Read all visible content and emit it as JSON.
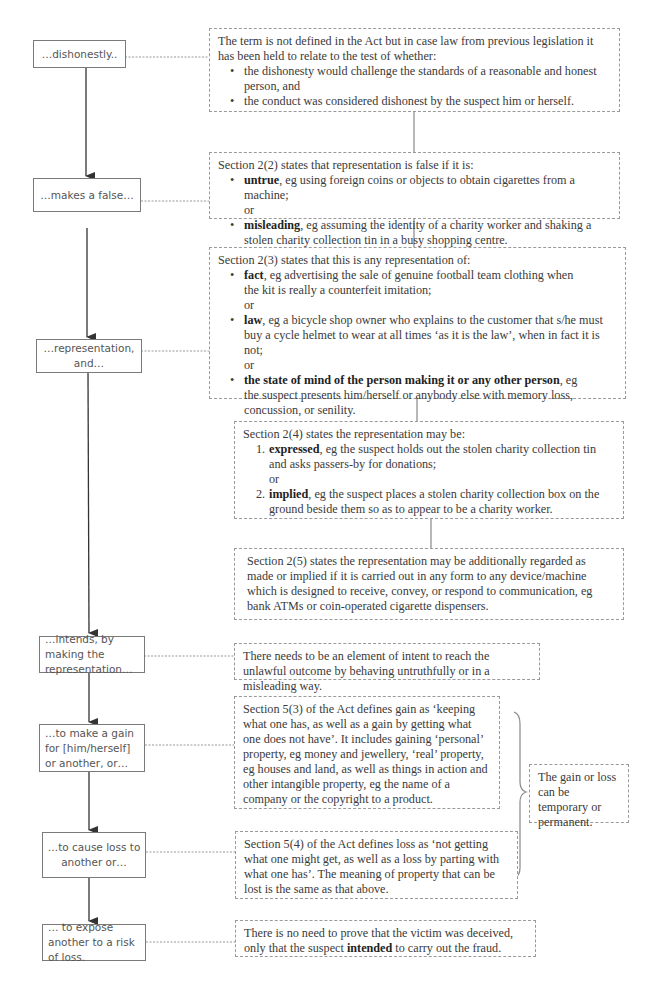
{
  "stages": [
    {
      "id": "dishonestly",
      "label": "…dishonestly.."
    },
    {
      "id": "makes-false",
      "label": "…makes a false…"
    },
    {
      "id": "representation",
      "label": "…representation, and…"
    },
    {
      "id": "intends",
      "label": "…intends, by making the representation…"
    },
    {
      "id": "gain",
      "label": "…to make a gain for [him/herself] or another, or…"
    },
    {
      "id": "loss",
      "label": "…to cause loss to another or…"
    },
    {
      "id": "expose",
      "label": "… to expose another to a risk of loss."
    }
  ],
  "notes": {
    "dishonestly": {
      "intro": "The term is not defined in the Act but in case law from previous legislation it has been held to relate to the test of whether:",
      "bullets": [
        "the dishonesty would challenge the standards of a reasonable and honest person, and",
        "the conduct was considered dishonest by the suspect him or herself."
      ]
    },
    "section_2_2": {
      "intro": "Section 2(2) states that representation is false if it is:",
      "items": [
        {
          "term": "untrue",
          "text": ", eg using foreign coins or objects to obtain cigarettes from a machine;"
        },
        {
          "term": "misleading",
          "text": ", eg assuming the identity of a charity worker and shaking a stolen charity collection tin in a busy shopping centre."
        }
      ],
      "or": "or"
    },
    "section_2_3": {
      "intro": "Section 2(3) states that this is any representation of:",
      "items": [
        {
          "term": "fact",
          "text": ", eg advertising the sale of genuine football team clothing when the kit is really a counterfeit imitation;"
        },
        {
          "term": "law",
          "text": ", eg a bicycle shop owner who explains to the customer that s/he must buy a cycle helmet to wear at all times ‘as it is the law’, when in fact it is not;"
        },
        {
          "term": "the state of mind of the person making it or any other person",
          "text": ", eg the suspect presents him/herself or anybody else with memory loss, concussion, or senility."
        }
      ],
      "or": "or"
    },
    "section_2_4": {
      "intro": "Section 2(4) states the representation may be:",
      "items": [
        {
          "num": "1.",
          "term": "expressed",
          "text": ", eg the suspect holds out the stolen charity collection tin and asks passers-by for donations;"
        },
        {
          "num": "2.",
          "term": "implied",
          "text": ", eg the suspect places a stolen charity collection box on the ground beside them so as to appear to be a charity worker."
        }
      ],
      "or": "or"
    },
    "section_2_5": {
      "text": "Section 2(5) states the representation may be additionally regarded as made or implied if it is carried out in any form to any device/machine which is designed to receive, convey, or respond to communication, eg bank ATMs or coin-operated cigarette dispensers."
    },
    "intends": {
      "text": "There needs to be an element of intent to reach the unlawful outcome by behaving untruthfully or in a misleading way."
    },
    "section_5_3": {
      "text": "Section 5(3) of the Act defines gain as ‘keeping what one has, as well as a gain by getting what one does not have’. It includes gaining ‘personal’ property, eg money and jewellery, ‘real’ property, eg houses and land, as well as things in action and other intangible property, eg the name of a company or the copyright to a product."
    },
    "section_5_4": {
      "text": "Section 5(4) of the Act defines loss as ‘not getting what one might get, as well as a loss by parting with what one has’. The meaning of property that can be lost is the same as that above."
    },
    "gain_or_loss": {
      "text": "The gain or loss can be temporary or permanent."
    },
    "expose": {
      "pre": "There is no need to prove that the victim was deceived, only that the suspect ",
      "bold": "intended",
      "post": " to carry out the fraud."
    }
  }
}
